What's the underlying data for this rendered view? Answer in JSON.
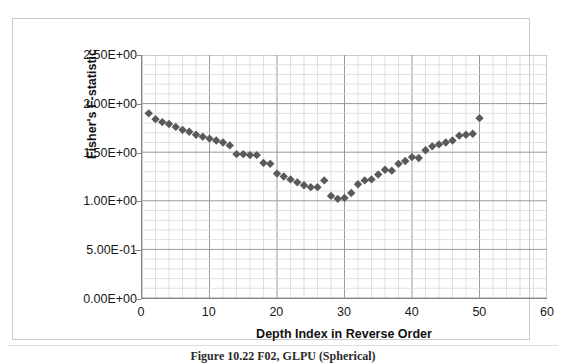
{
  "figure": {
    "caption": "Figure 10.22 F02, GLPU (Spherical)"
  },
  "chart_data": {
    "type": "scatter",
    "title": "",
    "xlabel": "Depth Index in Reverse Order",
    "ylabel": "Fisher's F-statistic",
    "xlim": [
      0,
      60
    ],
    "ylim": [
      0,
      2.5
    ],
    "xticks": [
      0,
      10,
      20,
      30,
      40,
      50,
      60
    ],
    "xtick_labels": [
      "0",
      "10",
      "20",
      "30",
      "40",
      "50",
      "60"
    ],
    "yticks": [
      0,
      0.5,
      1.0,
      1.5,
      2.0,
      2.5
    ],
    "ytick_labels": [
      "0.00E+00",
      "5.00E-01",
      "1.00E+00",
      "1.50E+00",
      "2.00E+00",
      "2.50E+00"
    ],
    "grid": true,
    "grid_minor_x_step": 2,
    "grid_minor_y_step": 0.1,
    "grid_major_x_step": 10,
    "grid_major_y_step": 0.5,
    "legend": "none",
    "marker": "diamond",
    "marker_color": "#5a5a5a",
    "marker_size": 6,
    "series": [
      {
        "name": "Fisher's F-statistic",
        "x": [
          1,
          2,
          3,
          4,
          5,
          6,
          7,
          8,
          9,
          10,
          11,
          12,
          13,
          14,
          15,
          16,
          17,
          18,
          19,
          20,
          21,
          22,
          23,
          24,
          25,
          26,
          27,
          28,
          29,
          30,
          31,
          32,
          33,
          34,
          35,
          36,
          37,
          38,
          39,
          40,
          41,
          42,
          43,
          44,
          45,
          46,
          47,
          48,
          49,
          50
        ],
        "y": [
          1.9,
          1.84,
          1.81,
          1.79,
          1.76,
          1.73,
          1.71,
          1.68,
          1.66,
          1.64,
          1.62,
          1.6,
          1.57,
          1.48,
          1.48,
          1.47,
          1.47,
          1.39,
          1.38,
          1.28,
          1.25,
          1.22,
          1.19,
          1.16,
          1.14,
          1.14,
          1.21,
          1.05,
          1.02,
          1.03,
          1.08,
          1.17,
          1.21,
          1.22,
          1.27,
          1.32,
          1.31,
          1.38,
          1.41,
          1.45,
          1.44,
          1.52,
          1.56,
          1.58,
          1.6,
          1.62,
          1.67,
          1.68,
          1.69,
          1.85
        ]
      }
    ]
  },
  "axes": {
    "y_label": "Fisher's F-statistic",
    "x_label": "Depth Index in Reverse Order"
  },
  "colors": {
    "marker": "#5a5a5a",
    "axis": "#868686",
    "grid_major": "#9a9a9a",
    "grid_minor": "#d8d8d8",
    "frame": "#c9c9c9",
    "text": "#181818"
  }
}
